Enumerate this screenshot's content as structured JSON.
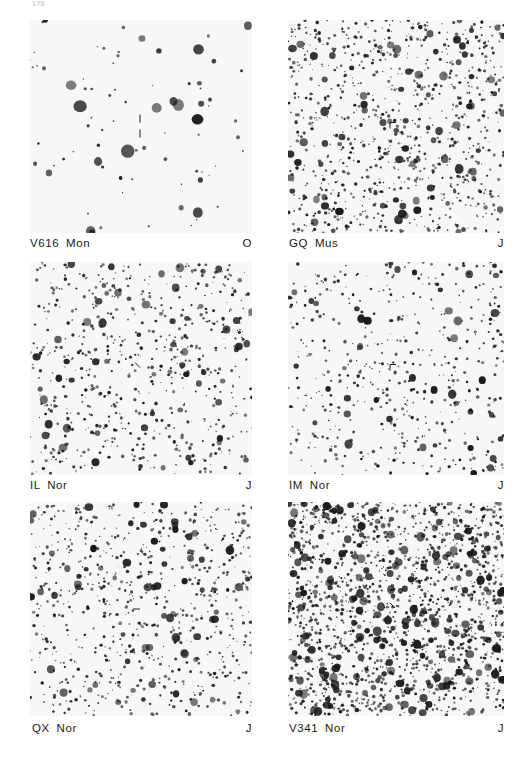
{
  "page": {
    "page_number": "178"
  },
  "panels": [
    {
      "id": "v616-mon",
      "name": "V616  Mon",
      "plate": "O",
      "density": 80,
      "seed": 11,
      "big": 0.3,
      "marker": "vertical-ticks"
    },
    {
      "id": "gq-mus",
      "name": "GQ  Mus",
      "plate": "J",
      "density": 900,
      "seed": 23,
      "big": 0.1,
      "marker": "corner"
    },
    {
      "id": "il-nor",
      "name": "IL  Nor",
      "plate": "J",
      "density": 650,
      "seed": 37,
      "big": 0.08,
      "marker": "diagonal"
    },
    {
      "id": "im-nor",
      "name": "IM  Nor",
      "plate": "J",
      "density": 520,
      "seed": 41,
      "big": 0.08,
      "marker": "corner"
    },
    {
      "id": "qx-nor",
      "name": "QX  Nor",
      "plate": "J",
      "density": 750,
      "seed": 53,
      "big": 0.1,
      "marker": "horizontal"
    },
    {
      "id": "v341-nor",
      "name": "V341  Nor",
      "plate": "J",
      "density": 1700,
      "seed": 67,
      "big": 0.12,
      "marker": "diagonal"
    }
  ],
  "colors": {
    "ink": "#1a1a1a",
    "plate_bg": "#f7f7f7"
  }
}
